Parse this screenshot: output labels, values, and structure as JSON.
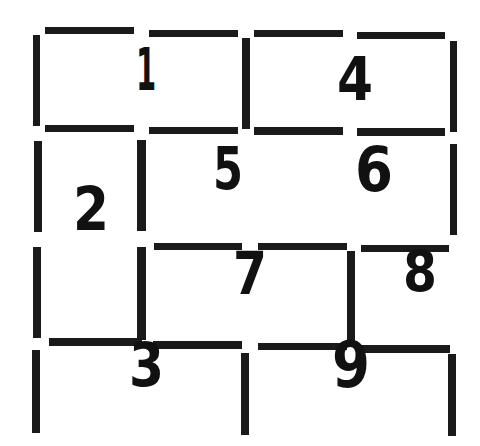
{
  "diagram": {
    "type": "grid-of-numbered-cells",
    "line_color": "#1a1a1a",
    "text_color": "#111111",
    "background": "#ffffff",
    "segments": [
      {
        "id": "h-top-1",
        "x": 45,
        "y": 27,
        "w": 89,
        "h": 7
      },
      {
        "id": "h-top-2",
        "x": 149,
        "y": 30,
        "w": 89,
        "h": 7
      },
      {
        "id": "h-top-3",
        "x": 254,
        "y": 30,
        "w": 89,
        "h": 7
      },
      {
        "id": "h-top-4",
        "x": 357,
        "y": 32,
        "w": 88,
        "h": 7
      },
      {
        "id": "v-r1-left",
        "x": 33,
        "y": 35,
        "w": 7,
        "h": 91
      },
      {
        "id": "v-r1-mid",
        "x": 242,
        "y": 38,
        "w": 8,
        "h": 91
      },
      {
        "id": "v-r1-right",
        "x": 450,
        "y": 41,
        "w": 7,
        "h": 91
      },
      {
        "id": "h-r1b-1",
        "x": 45,
        "y": 125,
        "w": 89,
        "h": 7
      },
      {
        "id": "h-r1b-2",
        "x": 149,
        "y": 127,
        "w": 89,
        "h": 7
      },
      {
        "id": "h-r1b-3",
        "x": 254,
        "y": 127,
        "w": 89,
        "h": 8
      },
      {
        "id": "h-r1b-4",
        "x": 357,
        "y": 128,
        "w": 88,
        "h": 8
      },
      {
        "id": "v-r2-left",
        "x": 34,
        "y": 141,
        "w": 8,
        "h": 91
      },
      {
        "id": "v-r2-mid",
        "x": 137,
        "y": 140,
        "w": 9,
        "h": 91
      },
      {
        "id": "v-r2-right",
        "x": 450,
        "y": 144,
        "w": 7,
        "h": 91
      },
      {
        "id": "h-r2b-1",
        "x": 154,
        "y": 243,
        "w": 88,
        "h": 7
      },
      {
        "id": "h-r2b-2",
        "x": 258,
        "y": 243,
        "w": 89,
        "h": 7
      },
      {
        "id": "h-r2b-3",
        "x": 361,
        "y": 245,
        "w": 88,
        "h": 7
      },
      {
        "id": "v-r3-left",
        "x": 33,
        "y": 247,
        "w": 8,
        "h": 91
      },
      {
        "id": "v-r3-mid",
        "x": 137,
        "y": 247,
        "w": 9,
        "h": 93
      },
      {
        "id": "v-r3-right",
        "x": 347,
        "y": 251,
        "w": 8,
        "h": 91
      },
      {
        "id": "h-r3b-1",
        "x": 49,
        "y": 338,
        "w": 93,
        "h": 8
      },
      {
        "id": "h-r3b-2",
        "x": 153,
        "y": 341,
        "w": 89,
        "h": 8
      },
      {
        "id": "h-r3b-3",
        "x": 258,
        "y": 343,
        "w": 89,
        "h": 7
      },
      {
        "id": "h-r3b-4",
        "x": 361,
        "y": 345,
        "w": 89,
        "h": 8
      },
      {
        "id": "v-r4-left",
        "x": 32,
        "y": 350,
        "w": 8,
        "h": 83
      },
      {
        "id": "v-r4-mid",
        "x": 241,
        "y": 353,
        "w": 8,
        "h": 82
      },
      {
        "id": "v-r4-right",
        "x": 448,
        "y": 354,
        "w": 8,
        "h": 82
      }
    ],
    "labels": [
      {
        "text": "1",
        "x": 136,
        "y": 49,
        "w": 17,
        "h": 44
      },
      {
        "text": "2",
        "x": 73,
        "y": 187,
        "w": 36,
        "h": 46
      },
      {
        "text": "3",
        "x": 129,
        "y": 343,
        "w": 35,
        "h": 46
      },
      {
        "text": "4",
        "x": 337,
        "y": 57,
        "w": 36,
        "h": 46
      },
      {
        "text": "5",
        "x": 213,
        "y": 147,
        "w": 30,
        "h": 45
      },
      {
        "text": "6",
        "x": 355,
        "y": 148,
        "w": 38,
        "h": 47
      },
      {
        "text": "7",
        "x": 233,
        "y": 253,
        "w": 34,
        "h": 44
      },
      {
        "text": "8",
        "x": 403,
        "y": 252,
        "w": 34,
        "h": 43
      },
      {
        "text": "9",
        "x": 332,
        "y": 343,
        "w": 38,
        "h": 48
      }
    ]
  }
}
